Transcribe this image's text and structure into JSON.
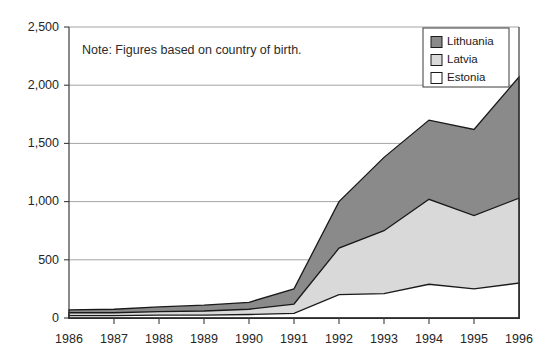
{
  "note": {
    "text": "Note: Figures based on country of birth."
  },
  "legend": {
    "position": "top-right",
    "items": [
      {
        "label": "Lithuania",
        "color": "#8a8a8a"
      },
      {
        "label": "Latvia",
        "color": "#d9d9d9"
      },
      {
        "label": "Estonia",
        "color": "#ffffff"
      }
    ]
  },
  "axes": {
    "y_ticks": [
      "0",
      "500",
      "1,000",
      "1,500",
      "2,000",
      "2,500"
    ],
    "x_ticks": [
      "1986",
      "1987",
      "1988",
      "1989",
      "1990",
      "1991",
      "1992",
      "1993",
      "1994",
      "1995",
      "1996"
    ]
  },
  "chart_data": {
    "type": "area",
    "stacked": true,
    "title": "",
    "subtitle": "",
    "xlabel": "",
    "ylabel": "",
    "xlim": [
      1986,
      1996
    ],
    "ylim": [
      0,
      2500
    ],
    "grid": true,
    "legend_position": "top-right",
    "annotations": [
      "Note: Figures based on country of birth."
    ],
    "categories": [
      "1986",
      "1987",
      "1988",
      "1989",
      "1990",
      "1991",
      "1992",
      "1993",
      "1994",
      "1995",
      "1996"
    ],
    "x": [
      1986,
      1987,
      1988,
      1989,
      1990,
      1991,
      1992,
      1993,
      1994,
      1995,
      1996
    ],
    "series": [
      {
        "name": "Estonia",
        "color": "#ffffff",
        "values": [
          20,
          20,
          25,
          25,
          30,
          40,
          200,
          210,
          290,
          250,
          300
        ]
      },
      {
        "name": "Latvia",
        "color": "#d9d9d9",
        "values": [
          25,
          25,
          30,
          35,
          45,
          80,
          400,
          540,
          730,
          630,
          730
        ]
      },
      {
        "name": "Lithuania",
        "color": "#8a8a8a",
        "values": [
          25,
          30,
          40,
          50,
          60,
          130,
          400,
          630,
          680,
          740,
          1040
        ]
      }
    ],
    "cumulative": {
      "estonia_top": [
        20,
        20,
        25,
        25,
        30,
        40,
        200,
        210,
        290,
        250,
        300
      ],
      "latvia_top": [
        45,
        45,
        55,
        60,
        75,
        120,
        600,
        750,
        1020,
        880,
        1030
      ],
      "total": [
        70,
        75,
        95,
        110,
        135,
        250,
        1000,
        1380,
        1700,
        1620,
        2070
      ]
    }
  }
}
